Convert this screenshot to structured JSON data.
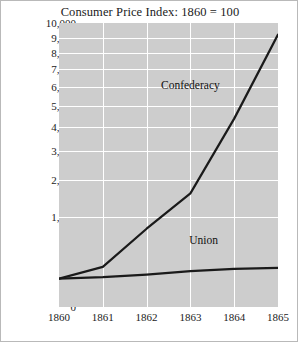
{
  "chart_data": {
    "type": "line",
    "title": "Consumer Price Index: 1860 = 100",
    "xlabel": "",
    "ylabel": "",
    "x": [
      1860,
      1861,
      1862,
      1863,
      1864,
      1865
    ],
    "xticklabels": [
      "1860",
      "1861",
      "1862",
      "1863",
      "1864",
      "1865"
    ],
    "yticks": [
      0,
      1000,
      2000,
      3000,
      4000,
      5000,
      6000,
      7000,
      8000,
      9000,
      10000
    ],
    "yticklabels": [
      "0",
      "1,000",
      "2,000",
      "3,000",
      "4,000",
      "5,000",
      "6,000",
      "7,000",
      "8,000",
      "9,000",
      "10,000"
    ],
    "ylim": [
      0,
      10000
    ],
    "yscale": "sqrt",
    "grid": true,
    "legend_position": "inline-annotation",
    "series": [
      {
        "name": "Confederacy",
        "values": [
          100,
          200,
          760,
          1600,
          4400,
          9200
        ],
        "color": "#1a1a1a",
        "label_x": 1863.0,
        "label_y": 6100
      },
      {
        "name": "Union",
        "values": [
          100,
          110,
          130,
          160,
          180,
          190
        ],
        "color": "#1a1a1a",
        "label_x": 1863.3,
        "label_y": 560
      }
    ],
    "colors": {
      "plot_background": "#cdcdcd",
      "gridline": "#ffffff",
      "line": "#1a1a1a",
      "text": "#1b1b1b",
      "frame_border": "#b9b9b9",
      "page_background": "#ffffff"
    }
  }
}
